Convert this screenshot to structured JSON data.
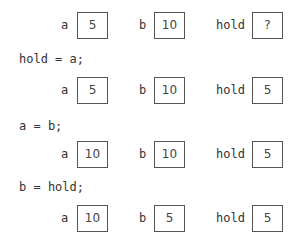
{
  "states": [
    {
      "a": "5",
      "b": "10",
      "hold": "?"
    },
    {
      "a": "5",
      "b": "10",
      "hold": "5"
    },
    {
      "a": "10",
      "b": "10",
      "hold": "5"
    },
    {
      "a": "10",
      "b": "5",
      "hold": "5"
    }
  ],
  "labels": {
    "a": "a",
    "b": "b",
    "hold": "hold"
  },
  "statements": [
    "hold = a;",
    "a = b;",
    "b = hold;"
  ]
}
